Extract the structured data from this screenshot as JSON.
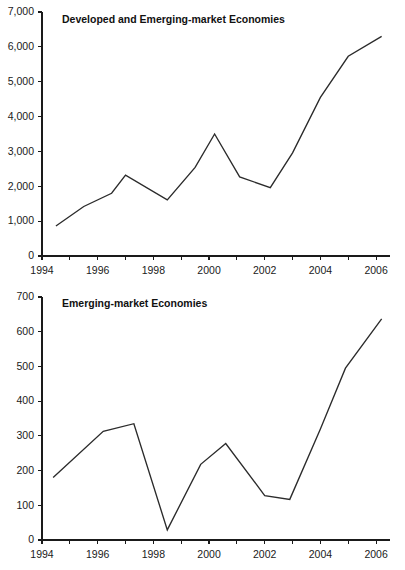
{
  "figure": {
    "background_color": "#ffffff",
    "line_color": "#2b2b2b",
    "axis_color": "#1a1a1a"
  },
  "panels": [
    {
      "id": "top",
      "title": "Developed and Emerging-market Economies"
    },
    {
      "id": "bottom",
      "title": "Emerging-market Economies"
    }
  ],
  "chart_data": [
    {
      "type": "line",
      "title": "Developed and Emerging-market Economies",
      "xlabel": "",
      "ylabel": "",
      "xlim": [
        1994,
        2006.5
      ],
      "ylim": [
        0,
        7000
      ],
      "grid": false,
      "legend": "none",
      "ytick_labels": [
        "0",
        "1,000",
        "2,000",
        "3,000",
        "4,000",
        "5,000",
        "6,000",
        "7,000"
      ],
      "ytick_values": [
        0,
        1000,
        2000,
        3000,
        4000,
        5000,
        6000,
        7000
      ],
      "xtick_labels": [
        "1994",
        "1996",
        "1998",
        "2000",
        "2002",
        "2004",
        "2006"
      ],
      "xtick_values": [
        1994,
        1996,
        1998,
        2000,
        2002,
        2004,
        2006
      ],
      "xminor_values": [
        1995,
        1997,
        1999,
        2001,
        2003,
        2005
      ],
      "x": [
        1994.5,
        1995.5,
        1996.5,
        1997.0,
        1998.5,
        1999.5,
        2000.2,
        2001.1,
        2002.2,
        2003.0,
        2004.0,
        2005.0,
        2006.2
      ],
      "values": [
        860,
        1420,
        1800,
        2320,
        1610,
        2540,
        3500,
        2270,
        1960,
        2960,
        4550,
        5730,
        6300
      ],
      "series": [
        {
          "name": "Developed and Emerging-market Economies",
          "values": [
            860,
            1420,
            1800,
            2320,
            1610,
            2540,
            3500,
            2270,
            1960,
            2960,
            4550,
            5730,
            6300
          ]
        }
      ]
    },
    {
      "type": "line",
      "title": "Emerging-market Economies",
      "xlabel": "",
      "ylabel": "",
      "xlim": [
        1994,
        2006.5
      ],
      "ylim": [
        0,
        700
      ],
      "grid": false,
      "legend": "none",
      "ytick_labels": [
        "0",
        "100",
        "200",
        "300",
        "400",
        "500",
        "600",
        "700"
      ],
      "ytick_values": [
        0,
        100,
        200,
        300,
        400,
        500,
        600,
        700
      ],
      "xtick_labels": [
        "1994",
        "1996",
        "1998",
        "2000",
        "2002",
        "2004",
        "2006"
      ],
      "xtick_values": [
        1994,
        1996,
        1998,
        2000,
        2002,
        2004,
        2006
      ],
      "xminor_values": [
        1995,
        1997,
        1999,
        2001,
        2003,
        2005
      ],
      "x": [
        1994.4,
        1996.2,
        1997.3,
        1998.5,
        1999.7,
        2000.6,
        2002.0,
        2002.9,
        2004.0,
        2004.9,
        2006.2
      ],
      "values": [
        180,
        313,
        335,
        29,
        218,
        278,
        128,
        117,
        320,
        495,
        637
      ],
      "series": [
        {
          "name": "Emerging-market Economies",
          "values": [
            180,
            313,
            335,
            29,
            218,
            278,
            128,
            117,
            320,
            495,
            637
          ]
        }
      ]
    }
  ]
}
